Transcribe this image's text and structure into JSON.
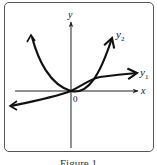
{
  "figure": {
    "labels": {
      "x_axis": "x",
      "y_axis": "y",
      "origin": "0",
      "curve1": "y",
      "curve1_sub": "1",
      "curve2": "y",
      "curve2_sub": "2"
    },
    "caption": "Figure 1"
  },
  "colors": {
    "curve": "#111111",
    "axis": "#222222",
    "frame": "#555555"
  }
}
